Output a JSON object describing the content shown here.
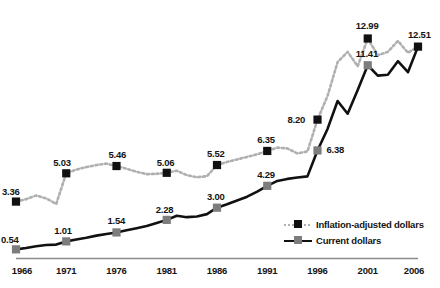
{
  "chart_data": {
    "type": "line",
    "title": "",
    "subtitle": "",
    "xlabel": "",
    "ylabel": "",
    "xlim": [
      1966,
      2006
    ],
    "ylim": [
      0,
      14.2
    ],
    "grid": false,
    "legend_position": "inside-bottom-right",
    "x": [
      1966,
      1967,
      1968,
      1969,
      1970,
      1971,
      1972,
      1973,
      1974,
      1975,
      1976,
      1977,
      1978,
      1979,
      1980,
      1981,
      1982,
      1983,
      1984,
      1985,
      1986,
      1987,
      1988,
      1989,
      1990,
      1991,
      1992,
      1993,
      1994,
      1995,
      1996,
      1997,
      1998,
      1999,
      2000,
      2001,
      2002,
      2003,
      2004,
      2005,
      2006
    ],
    "tick_labels": [
      "1966",
      "1971",
      "1976",
      "1981",
      "1986",
      "1991",
      "1996",
      "2001",
      "2006"
    ],
    "tick_values": [
      1966,
      1971,
      1976,
      1981,
      1986,
      1991,
      1996,
      2001,
      2006
    ],
    "series": [
      {
        "name": "Inflation-adjusted dollars",
        "color": "#b0b0b0",
        "marker_color": "#111111",
        "style": "dotted",
        "values": [
          3.36,
          3.5,
          3.72,
          3.55,
          3.22,
          5.03,
          5.25,
          5.4,
          5.52,
          5.6,
          5.46,
          5.3,
          5.12,
          4.98,
          5.0,
          5.06,
          5.18,
          4.92,
          4.8,
          4.86,
          5.52,
          5.7,
          5.85,
          6.0,
          6.15,
          6.35,
          6.55,
          6.5,
          6.2,
          6.32,
          8.2,
          9.6,
          11.6,
          12.2,
          11.35,
          12.99,
          12.0,
          12.2,
          12.85,
          12.15,
          12.51
        ],
        "labeled_points": [
          {
            "x": 1966,
            "value": 3.36,
            "label": "3.36"
          },
          {
            "x": 1971,
            "value": 5.03,
            "label": "5.03"
          },
          {
            "x": 1976,
            "value": 5.46,
            "label": "5.46"
          },
          {
            "x": 1981,
            "value": 5.06,
            "label": "5.06"
          },
          {
            "x": 1986,
            "value": 5.52,
            "label": "5.52"
          },
          {
            "x": 1991,
            "value": 6.35,
            "label": "6.35"
          },
          {
            "x": 1996,
            "value": 8.2,
            "label": "8.20"
          },
          {
            "x": 2001,
            "value": 12.99,
            "label": "12.99"
          },
          {
            "x": 2006,
            "value": 12.51,
            "label": "12.51"
          }
        ]
      },
      {
        "name": "Current dollars",
        "color": "#111111",
        "marker_color": "#7d7d7d",
        "style": "solid",
        "values": [
          0.54,
          0.62,
          0.72,
          0.8,
          0.82,
          1.01,
          1.12,
          1.22,
          1.35,
          1.45,
          1.54,
          1.67,
          1.79,
          1.92,
          2.1,
          2.28,
          2.52,
          2.44,
          2.48,
          2.62,
          3.0,
          3.2,
          3.42,
          3.65,
          3.95,
          4.29,
          4.58,
          4.7,
          4.78,
          4.85,
          6.38,
          7.65,
          9.3,
          8.55,
          9.95,
          11.41,
          10.8,
          10.85,
          11.65,
          11.0,
          12.51
        ],
        "labeled_points": [
          {
            "x": 1966,
            "value": 0.54,
            "label": "0.54"
          },
          {
            "x": 1971,
            "value": 1.01,
            "label": "1.01"
          },
          {
            "x": 1976,
            "value": 1.54,
            "label": "1.54"
          },
          {
            "x": 1981,
            "value": 2.28,
            "label": "2.28"
          },
          {
            "x": 1986,
            "value": 3.0,
            "label": "3.00"
          },
          {
            "x": 1991,
            "value": 4.29,
            "label": "4.29"
          },
          {
            "x": 1996,
            "value": 6.38,
            "label": "6.38"
          },
          {
            "x": 2001,
            "value": 11.41,
            "label": "11.41"
          }
        ]
      }
    ]
  },
  "legend": {
    "items": [
      {
        "label": "Inflation-adjusted dollars"
      },
      {
        "label": "Current dollars"
      }
    ]
  },
  "axis": {
    "baseline_color": "#8c8c8c"
  }
}
